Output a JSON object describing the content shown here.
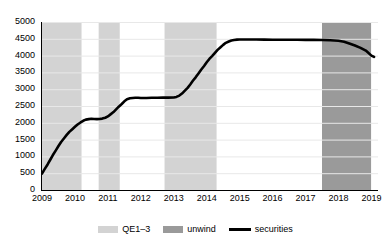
{
  "chart_data": {
    "type": "line",
    "title": "",
    "xlabel": "",
    "ylabel": "",
    "grid": true,
    "legend_position": "bottom",
    "xlim": [
      2009.0,
      2019.2
    ],
    "ylim": [
      0,
      5000
    ],
    "y_ticks": [
      0,
      500,
      1000,
      1500,
      2000,
      2500,
      3000,
      3500,
      4000,
      4500,
      5000
    ],
    "y_tick_labels": [
      "0",
      "500",
      "1000",
      "1500",
      "2000",
      "2500",
      "3000",
      "3500",
      "4000",
      "4500",
      "5000"
    ],
    "x_ticks": [
      2009,
      2010,
      2011,
      2012,
      2013,
      2014,
      2015,
      2016,
      2017,
      2018,
      2019
    ],
    "x_tick_labels": [
      "2009",
      "2010",
      "2011",
      "2012",
      "2013",
      "2014",
      "2015",
      "2016",
      "2017",
      "2018",
      "2019"
    ],
    "series": [
      {
        "name": "securities",
        "color": "#000000",
        "x": [
          2009.0,
          2009.08,
          2009.17,
          2009.25,
          2009.33,
          2009.42,
          2009.5,
          2009.58,
          2009.67,
          2009.75,
          2009.83,
          2009.92,
          2010.0,
          2010.08,
          2010.17,
          2010.25,
          2010.33,
          2010.42,
          2010.5,
          2010.58,
          2010.67,
          2010.75,
          2010.83,
          2010.92,
          2011.0,
          2011.08,
          2011.17,
          2011.25,
          2011.33,
          2011.42,
          2011.5,
          2011.58,
          2011.67,
          2011.75,
          2011.83,
          2011.92,
          2012.0,
          2012.17,
          2012.33,
          2012.5,
          2012.67,
          2012.83,
          2013.0,
          2013.08,
          2013.17,
          2013.25,
          2013.33,
          2013.42,
          2013.5,
          2013.58,
          2013.67,
          2013.75,
          2013.83,
          2013.92,
          2014.0,
          2014.08,
          2014.17,
          2014.25,
          2014.33,
          2014.42,
          2014.5,
          2014.58,
          2014.67,
          2014.75,
          2014.83,
          2014.92,
          2015.0,
          2015.25,
          2015.5,
          2015.75,
          2016.0,
          2016.25,
          2016.5,
          2016.75,
          2017.0,
          2017.25,
          2017.5,
          2017.75,
          2018.0,
          2018.17,
          2018.33,
          2018.5,
          2018.67,
          2018.83,
          2019.0,
          2019.08
        ],
        "y": [
          490,
          620,
          760,
          900,
          1040,
          1180,
          1310,
          1430,
          1540,
          1640,
          1730,
          1810,
          1880,
          1950,
          2010,
          2060,
          2095,
          2110,
          2120,
          2115,
          2110,
          2115,
          2125,
          2150,
          2190,
          2250,
          2320,
          2400,
          2480,
          2560,
          2640,
          2700,
          2730,
          2740,
          2745,
          2745,
          2740,
          2740,
          2745,
          2745,
          2750,
          2750,
          2755,
          2770,
          2810,
          2870,
          2950,
          3040,
          3140,
          3250,
          3360,
          3470,
          3580,
          3690,
          3800,
          3900,
          3990,
          4080,
          4170,
          4250,
          4320,
          4380,
          4420,
          4450,
          4465,
          4475,
          4480,
          4480,
          4478,
          4475,
          4472,
          4470,
          4472,
          4470,
          4468,
          4470,
          4465,
          4455,
          4440,
          4410,
          4360,
          4300,
          4230,
          4150,
          4000,
          3960
        ]
      }
    ],
    "shaded_bands": [
      {
        "label": "QE1-3",
        "type": "qe",
        "x0": 2009.0,
        "x1": 2010.2,
        "color": "#d3d3d3"
      },
      {
        "label": "QE1-3",
        "type": "qe",
        "x0": 2010.72,
        "x1": 2011.36,
        "color": "#d3d3d3"
      },
      {
        "label": "QE1-3",
        "type": "qe",
        "x0": 2012.72,
        "x1": 2014.3,
        "color": "#d3d3d3"
      },
      {
        "label": "unwind",
        "type": "unwind",
        "x0": 2017.5,
        "x1": 2018.99,
        "color": "#9a9a9a"
      }
    ],
    "legend": [
      {
        "key": "qe",
        "label": "QE1–3",
        "swatch": "#d3d3d3",
        "style": "box"
      },
      {
        "key": "unwind",
        "label": "unwind",
        "swatch": "#9a9a9a",
        "style": "box"
      },
      {
        "key": "securities",
        "label": "securities",
        "swatch": "#000000",
        "style": "line"
      }
    ],
    "colors": {
      "qe_band": "#d3d3d3",
      "unwind_band": "#9a9a9a",
      "line": "#000000",
      "gridline": "#e8e8e8",
      "axis": "#000000",
      "background": "#ffffff"
    }
  }
}
